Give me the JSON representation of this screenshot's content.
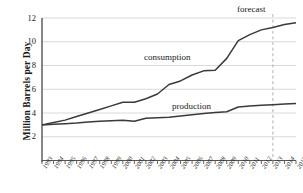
{
  "chart_data": {
    "type": "line",
    "title": "",
    "xlabel": "",
    "ylabel": "Million Barrels per Day",
    "x": [
      1993,
      1994,
      1995,
      1996,
      1997,
      1998,
      1999,
      2000,
      2001,
      2002,
      2003,
      2004,
      2005,
      2006,
      2007,
      2008,
      2009,
      2010,
      2011,
      2012,
      2013,
      2014,
      2015
    ],
    "xtick_labels": [
      "1993",
      "1994",
      "1995",
      "1996",
      "1997",
      "1998",
      "1999",
      "2000",
      "2001",
      "2002",
      "2003",
      "2004",
      "2005",
      "2006",
      "2007",
      "2008",
      "2009",
      "2010",
      "2011",
      "2012",
      "2013",
      "2014",
      "2015"
    ],
    "ytick_labels": [
      "2",
      "4",
      "6",
      "8",
      "10",
      "12"
    ],
    "yticks": [
      2,
      4,
      6,
      8,
      10,
      12
    ],
    "xlim": [
      1993,
      2015
    ],
    "ylim": [
      0,
      12
    ],
    "grid": true,
    "grid_axis": "y",
    "legend_position": "inline-annotation",
    "series": [
      {
        "name": "consumption",
        "color": "#3a3a3a",
        "values": [
          3.0,
          3.2,
          3.4,
          3.7,
          4.0,
          4.3,
          4.6,
          4.9,
          4.9,
          5.2,
          5.6,
          6.4,
          6.7,
          7.2,
          7.55,
          7.6,
          8.6,
          10.1,
          10.6,
          11.0,
          11.2,
          11.45,
          11.6
        ]
      },
      {
        "name": "production",
        "color": "#3a3a3a",
        "values": [
          3.0,
          3.05,
          3.1,
          3.15,
          3.25,
          3.3,
          3.35,
          3.4,
          3.3,
          3.55,
          3.6,
          3.65,
          3.75,
          3.85,
          3.95,
          4.05,
          4.1,
          4.5,
          4.6,
          4.65,
          4.7,
          4.75,
          4.8
        ]
      }
    ],
    "annotations": [
      {
        "name": "forecast",
        "label": "forecast",
        "x": 2013,
        "type": "vertical-dashed-line",
        "color": "#b0b0b0"
      }
    ]
  }
}
